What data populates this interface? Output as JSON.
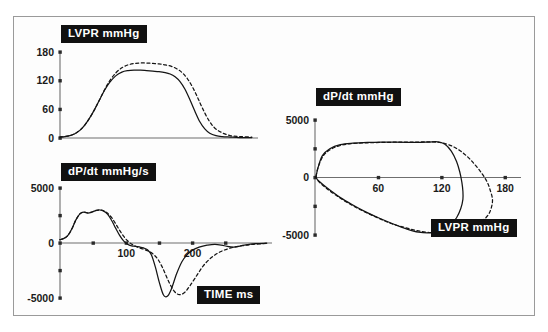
{
  "figure": {
    "background_color": "#ffffff",
    "border_color": "#9a9a9a",
    "curve_color": "#141414",
    "label_box_background": "#111111",
    "label_box_text_color": "#ffffff"
  },
  "chart_data": [
    {
      "id": "lvpr-time",
      "type": "line",
      "title": "LVPR  mmHg",
      "xlabel": "",
      "ylabel": "LVPR  mmHg",
      "xlim": [
        0,
        320
      ],
      "ylim": [
        0,
        180
      ],
      "yticks": [
        0,
        60,
        120,
        180
      ],
      "ytick_labels": [
        "0",
        "60",
        "120",
        "180"
      ],
      "xticks": [],
      "xtick_labels": [],
      "grid": false,
      "legend": "none",
      "series": [
        {
          "name": "solid",
          "style": "solid",
          "x": [
            0,
            8,
            16,
            24,
            32,
            40,
            48,
            56,
            64,
            72,
            80,
            90,
            100,
            110,
            120,
            130,
            140,
            150,
            160,
            170,
            178,
            186,
            194,
            202,
            210,
            218,
            226,
            234,
            242,
            252,
            262,
            275,
            290,
            310
          ],
          "y": [
            2,
            3,
            5,
            9,
            16,
            27,
            42,
            60,
            80,
            100,
            116,
            130,
            138,
            141,
            142,
            142,
            141,
            140,
            139,
            137,
            134,
            128,
            118,
            102,
            80,
            56,
            34,
            19,
            10,
            5,
            3,
            2,
            1,
            1
          ]
        },
        {
          "name": "dashed",
          "style": "dashed",
          "x": [
            0,
            8,
            16,
            24,
            32,
            40,
            48,
            56,
            64,
            72,
            80,
            90,
            100,
            110,
            120,
            130,
            140,
            150,
            160,
            170,
            180,
            190,
            198,
            206,
            214,
            222,
            230,
            240,
            250,
            262,
            275,
            290,
            310
          ],
          "y": [
            2,
            3,
            5,
            9,
            16,
            27,
            42,
            60,
            80,
            101,
            119,
            136,
            147,
            153,
            156,
            157,
            157,
            156,
            155,
            153,
            150,
            144,
            136,
            124,
            107,
            86,
            63,
            38,
            21,
            11,
            5,
            3,
            2
          ]
        }
      ]
    },
    {
      "id": "dpdt-time",
      "type": "line",
      "title": "dP/dt  mmHg/s",
      "xlabel": "TIME  ms",
      "ylabel": "dP/dt  mmHg/s",
      "xlim": [
        0,
        320
      ],
      "ylim": [
        -5000,
        5000
      ],
      "yticks": [
        -5000,
        -2500,
        0,
        2500,
        5000
      ],
      "ytick_labels": [
        "-5000",
        "",
        "0",
        "",
        "5000"
      ],
      "xticks": [
        50,
        100,
        150,
        200,
        250
      ],
      "xtick_labels": [
        "",
        "100",
        "",
        "200",
        ""
      ],
      "grid": false,
      "legend": "none",
      "series": [
        {
          "name": "solid",
          "style": "solid",
          "x": [
            0,
            6,
            12,
            18,
            24,
            30,
            36,
            42,
            48,
            54,
            60,
            66,
            72,
            78,
            84,
            90,
            96,
            102,
            108,
            114,
            120,
            126,
            132,
            138,
            144,
            150,
            156,
            162,
            168,
            176,
            184,
            192,
            200,
            210,
            222,
            234,
            248,
            262,
            278,
            295,
            312
          ],
          "y": [
            300,
            420,
            700,
            1300,
            2100,
            2650,
            2800,
            2720,
            2800,
            2950,
            3000,
            2900,
            2600,
            2050,
            1350,
            700,
            200,
            -120,
            -260,
            -300,
            -360,
            -450,
            -620,
            -1100,
            -2200,
            -3600,
            -4700,
            -4850,
            -4200,
            -2800,
            -1700,
            -1050,
            -650,
            -380,
            -200,
            -120,
            -250,
            -380,
            -200,
            -60,
            -20
          ]
        },
        {
          "name": "dashed",
          "style": "dashed",
          "x": [
            0,
            6,
            12,
            18,
            24,
            30,
            36,
            42,
            48,
            54,
            60,
            66,
            72,
            78,
            84,
            90,
            96,
            102,
            108,
            114,
            120,
            126,
            132,
            140,
            148,
            156,
            164,
            172,
            180,
            188,
            196,
            206,
            216,
            228,
            242,
            258,
            275,
            292,
            312
          ],
          "y": [
            300,
            420,
            700,
            1300,
            2100,
            2650,
            2800,
            2740,
            2820,
            2960,
            3000,
            2920,
            2700,
            2300,
            1750,
            1150,
            620,
            200,
            -100,
            -300,
            -450,
            -560,
            -700,
            -980,
            -1500,
            -2400,
            -3500,
            -4350,
            -4700,
            -4500,
            -3900,
            -3000,
            -2100,
            -1350,
            -800,
            -450,
            -250,
            -120,
            -40
          ]
        }
      ]
    },
    {
      "id": "phase-loop",
      "type": "line",
      "title": "dP/dt  mmHg",
      "xlabel": "LVPR  mmHg",
      "ylabel": "dP/dt  mmHg",
      "xlim": [
        0,
        195
      ],
      "ylim": [
        -5000,
        5000
      ],
      "yticks": [
        -5000,
        -2500,
        0,
        2500,
        5000
      ],
      "ytick_labels": [
        "-5000",
        "",
        "0",
        "",
        "5000"
      ],
      "xticks": [
        60,
        120,
        180
      ],
      "xtick_labels": [
        "60",
        "120",
        "180"
      ],
      "grid": false,
      "legend": "none",
      "series": [
        {
          "name": "solid",
          "style": "solid",
          "closed": true,
          "x": [
            1,
            3,
            7,
            14,
            24,
            36,
            50,
            63,
            76,
            88,
            98,
            108,
            116,
            123,
            129,
            134,
            137,
            139,
            140,
            140,
            138,
            134,
            128,
            120,
            110,
            98,
            86,
            73,
            60,
            47,
            35,
            24,
            15,
            8,
            3,
            1
          ],
          "y": [
            100,
            900,
            1900,
            2500,
            2850,
            2980,
            3050,
            3080,
            3080,
            3060,
            3050,
            3080,
            3100,
            2900,
            2300,
            1400,
            500,
            -400,
            -1200,
            -1900,
            -2700,
            -3500,
            -4150,
            -4600,
            -4800,
            -4750,
            -4450,
            -4000,
            -3500,
            -2950,
            -2350,
            -1750,
            -1150,
            -650,
            -250,
            0
          ]
        },
        {
          "name": "dashed",
          "style": "dashed",
          "closed": true,
          "x": [
            1,
            3,
            8,
            16,
            27,
            40,
            54,
            68,
            82,
            95,
            107,
            118,
            128,
            137,
            145,
            152,
            158,
            163,
            166,
            168,
            167,
            164,
            158,
            150,
            140,
            128,
            115,
            101,
            87,
            72,
            58,
            44,
            31,
            20,
            11,
            4,
            1
          ],
          "y": [
            100,
            900,
            1900,
            2500,
            2850,
            2980,
            3030,
            3060,
            3070,
            3080,
            3100,
            3050,
            2800,
            2350,
            1750,
            1050,
            350,
            -400,
            -1150,
            -1900,
            -2600,
            -3250,
            -3800,
            -4250,
            -4600,
            -4800,
            -4820,
            -4700,
            -4400,
            -4000,
            -3450,
            -2850,
            -2200,
            -1550,
            -950,
            -400,
            0
          ]
        }
      ]
    }
  ],
  "labels": {
    "lvpr_top": "LVPR   mmHg",
    "dpdt_bottom": "dP/dt  mmHg/s",
    "time_bottom": "TIME  ms",
    "dpdt_right": "dP/dt  mmHg",
    "lvpr_right": "LVPR   mmHg"
  }
}
